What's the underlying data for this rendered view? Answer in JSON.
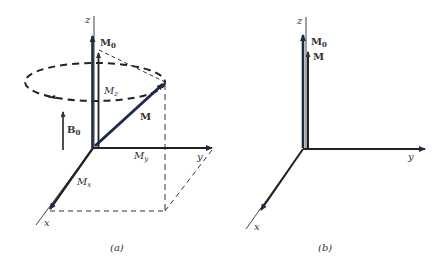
{
  "figure": {
    "panels": [
      {
        "id": "a",
        "caption": "(a)",
        "axis_labels": {
          "z": "z",
          "y": "y",
          "x": "x"
        },
        "vectors": {
          "M0": {
            "label": "M",
            "sub": "0"
          },
          "M": {
            "label": "M"
          },
          "B0": {
            "label": "B",
            "sub": "0"
          }
        },
        "components": {
          "Mz": {
            "label": "M",
            "sub": "z"
          },
          "My": {
            "label": "M",
            "sub": "y"
          },
          "Mx": {
            "label": "M",
            "sub": "x"
          }
        },
        "precession_path": "dashed ellipse with counter-clockwise arrow"
      },
      {
        "id": "b",
        "caption": "(b)",
        "axis_labels": {
          "z": "z",
          "y": "y",
          "x": "x"
        },
        "vectors": {
          "M0": {
            "label": "M",
            "sub": "0"
          },
          "M": {
            "label": "M"
          }
        }
      }
    ],
    "colors": {
      "vector": "#1e2a4a",
      "axis": "#333333",
      "dashed": "#333333"
    }
  }
}
